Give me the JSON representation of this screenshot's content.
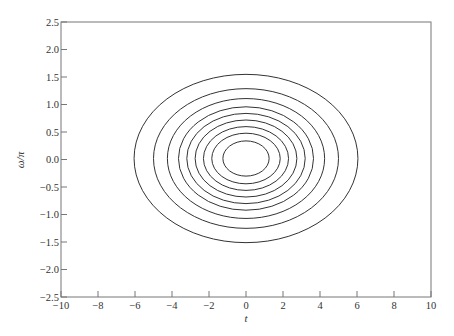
{
  "chart_data": {
    "type": "contour",
    "title": "",
    "xlabel": "t",
    "ylabel": "ω/π",
    "xlim": [
      -10,
      10
    ],
    "ylim": [
      -2.5,
      2.5
    ],
    "grid": false,
    "legend": null,
    "x_ticks": [
      -10,
      -8,
      -6,
      -4,
      -2,
      0,
      2,
      4,
      6,
      8,
      10
    ],
    "x_tick_labels": [
      "−10",
      "−8",
      "−6",
      "−4",
      "−2",
      "0",
      "2",
      "4",
      "6",
      "8",
      "10"
    ],
    "y_ticks": [
      2.5,
      2.0,
      1.5,
      1.0,
      0.5,
      0.0,
      -0.5,
      -1.0,
      -1.5,
      -2.0,
      -2.5
    ],
    "y_tick_labels": [
      "2.5",
      "2.0",
      "1.5",
      "1.0",
      "0.5",
      "0.0",
      "−0.5",
      "−1.0",
      "−1.5",
      "−2.0",
      "−2.5"
    ],
    "contours": {
      "shape": "ellipse",
      "center": [
        0,
        0
      ],
      "levels": [
        {
          "t_semi_axis": 6.05,
          "w_semi_axis": 1.53
        },
        {
          "t_semi_axis": 5.0,
          "w_semi_axis": 1.27
        },
        {
          "t_semi_axis": 4.25,
          "w_semi_axis": 1.09
        },
        {
          "t_semi_axis": 3.65,
          "w_semi_axis": 0.94
        },
        {
          "t_semi_axis": 3.2,
          "w_semi_axis": 0.82
        },
        {
          "t_semi_axis": 2.75,
          "w_semi_axis": 0.7
        },
        {
          "t_semi_axis": 2.3,
          "w_semi_axis": 0.58
        },
        {
          "t_semi_axis": 1.85,
          "w_semi_axis": 0.46
        },
        {
          "t_semi_axis": 1.25,
          "w_semi_axis": 0.32
        }
      ],
      "line_color": "#333333"
    }
  },
  "style": {
    "axis_color": "#777777",
    "line_color": "#333333",
    "background": "#ffffff"
  }
}
